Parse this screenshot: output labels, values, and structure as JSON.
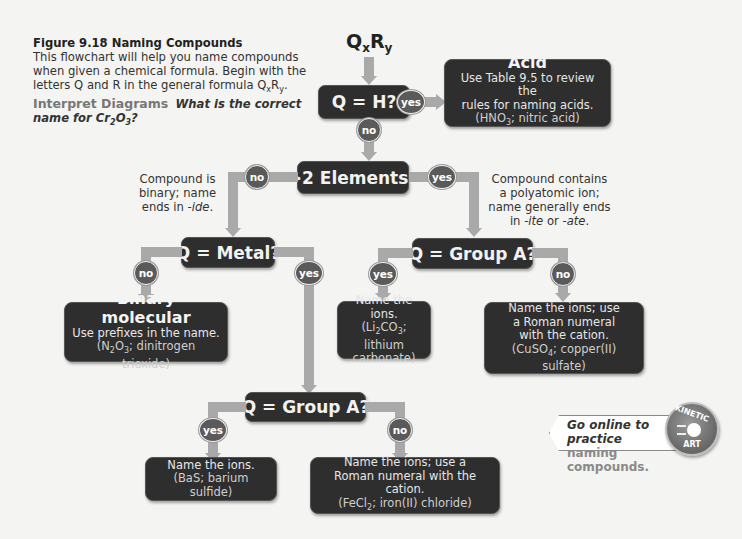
{
  "caption": {
    "figure_title": "Figure 9.18  Naming Compounds",
    "body": "This flowchart will help you name compounds when given a chemical formula. Begin with the letters Q and R in the general formula QxRy.",
    "body_parts": {
      "text": "This flowchart will help you name compounds when given a chemical formula. Begin with the letters Q and R in the general formula Q",
      "sub_x": "x",
      "r": "R",
      "sub_y": "y",
      "end": "."
    },
    "interpret_label": "Interpret Diagrams",
    "question_parts": {
      "pre": "What is the correct name for Cr",
      "sub1": "2",
      "o": "O",
      "sub2": "3",
      "end": "?"
    }
  },
  "start": {
    "q": "Q",
    "x": "x",
    "r": "R",
    "y": "y"
  },
  "nodes": {
    "q_h": "Q = H?",
    "gt2": ">2 Elements?",
    "q_metal": "Q = Metal?",
    "q_groupa_right": "Q = Group A?",
    "q_groupa_bottom": "Q = Group A?"
  },
  "badges": {
    "yes": "yes",
    "no": "no"
  },
  "notes": {
    "binary": {
      "l1": "Compound is",
      "l2": "binary; name",
      "l3_pre": "ends in ",
      "l3_em": "-ide",
      "l3_end": "."
    },
    "poly": {
      "l1": "Compound contains",
      "l2": "a polyatomic ion;",
      "l3": "name generally ends",
      "l4_pre": "in ",
      "l4_em1": "-ite",
      "l4_mid": " or ",
      "l4_em2": "-ate",
      "l4_end": "."
    }
  },
  "boxes": {
    "acid": {
      "title": "Acid",
      "l1": "Use Table 9.5 to review the",
      "l2": "rules for naming acids.",
      "ex_pre": "(HNO",
      "ex_sub": "3",
      "ex_post": "; nitric acid)"
    },
    "binary_molecular": {
      "title": "Binary molecular",
      "l1": "Use prefixes in the name.",
      "ex_a": "(N",
      "ex_sub1": "2",
      "ex_b": "O",
      "ex_sub2": "3",
      "ex_c": "; dinitrogen trioxide)"
    },
    "poly_groupa": {
      "l1": "Name the ions.",
      "ex_a": "(Li",
      "ex_sub1": "2",
      "ex_b": "CO",
      "ex_sub2": "3",
      "ex_c": "; lithium",
      "l3": "carbonate)"
    },
    "poly_not_groupa": {
      "l1": "Name the ions; use",
      "l2": "a Roman numeral",
      "l3": "with the cation.",
      "ex_a": "(CuSO",
      "ex_sub": "4",
      "ex_c": "; copper(II) sulfate)"
    },
    "ionic_groupa": {
      "l1": "Name the ions.",
      "ex": "(BaS; barium sulfide)"
    },
    "ionic_not_groupa": {
      "l1": "Name the ions; use a",
      "l2": "Roman numeral with the cation.",
      "ex_a": "(FeCl",
      "ex_sub": "2",
      "ex_c": "; iron(II) chloride)"
    }
  },
  "kinetic": {
    "line1": "Go online to practice",
    "line2": "naming compounds.",
    "badge_top": "KINETIC",
    "badge_bottom": "ART"
  },
  "colors": {
    "node_bg": "#2e2e2e",
    "connector": "#a9a9a9",
    "badge_bg": "#5a5a5a",
    "page_bg": "#f4f4f2"
  }
}
